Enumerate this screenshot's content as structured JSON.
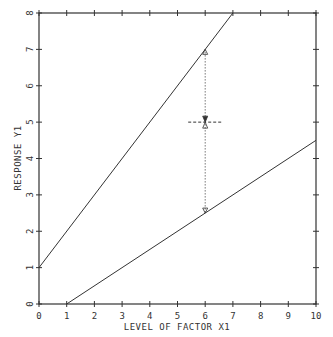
{
  "chart_data": {
    "type": "line",
    "title": "",
    "xlabel": "LEVEL OF FACTOR X1",
    "ylabel": "RESPONSE Y1",
    "xlim": [
      0,
      10
    ],
    "ylim": [
      0,
      8
    ],
    "x_ticks": [
      "0",
      "1",
      "2",
      "3",
      "4",
      "5",
      "6",
      "7",
      "8",
      "9",
      "10"
    ],
    "y_ticks": [
      "0",
      "1",
      "2",
      "3",
      "4",
      "5",
      "6",
      "7",
      "8"
    ],
    "grid": false,
    "legend": null,
    "series": [
      {
        "name": "upper line",
        "x": [
          0,
          7
        ],
        "y": [
          1,
          8
        ]
      },
      {
        "name": "lower line",
        "x": [
          1,
          10
        ],
        "y": [
          0,
          4.5
        ]
      }
    ],
    "annotations": [
      {
        "type": "vertical-dotted-interval",
        "x": 6,
        "y_from": 2.5,
        "y_to": 7
      },
      {
        "type": "midpoint-crosshair",
        "x": 6,
        "y": 5
      }
    ]
  },
  "colors": {
    "line": "#333333",
    "axis": "#333333",
    "background": "#ffffff"
  }
}
